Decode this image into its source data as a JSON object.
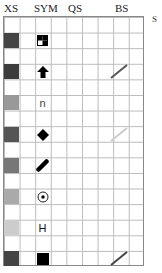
{
  "headers": {
    "xs": "XS",
    "sym": "SYM",
    "qs": "QS",
    "bs": "BS"
  },
  "side_label": "S",
  "rows": [
    {
      "swatch": "#444444",
      "symbol": "checker-square-icon",
      "glyph": "",
      "bs": ""
    },
    {
      "swatch": "#3c3c3c",
      "symbol": "up-arrow-icon",
      "glyph": "",
      "bs": "#555555"
    },
    {
      "swatch": "#999999",
      "symbol": "n-glyph-icon",
      "glyph": "n",
      "bs": ""
    },
    {
      "swatch": "#555555",
      "symbol": "diamond-icon",
      "glyph": "",
      "bs": "#cccccc"
    },
    {
      "swatch": "#777777",
      "symbol": "capsule-icon",
      "glyph": "",
      "bs": ""
    },
    {
      "swatch": "#aaaaaa",
      "symbol": "circle-dot-icon",
      "glyph": "",
      "bs": ""
    },
    {
      "swatch": "#cccccc",
      "symbol": "h-glyph-icon",
      "glyph": "H",
      "bs": ""
    },
    {
      "swatch": "#444444",
      "symbol": "filled-square-icon",
      "glyph": "",
      "bs": "#444444"
    }
  ]
}
